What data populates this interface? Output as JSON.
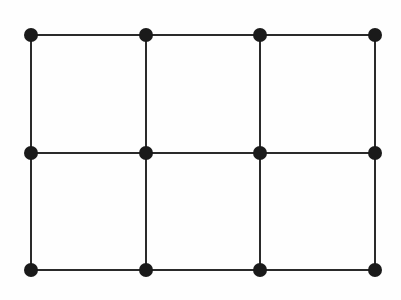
{
  "figure": {
    "type": "grid-graph",
    "rows": 3,
    "cols": 4,
    "column_x": [
      31,
      146,
      260,
      375
    ],
    "row_y": [
      35,
      153,
      270
    ],
    "node_radius": 7,
    "edge_width": 2,
    "node_color": "#1a1a1a",
    "edge_color": "#2a2a2a",
    "background": "#fefefe",
    "nodes": [
      {
        "id": "v-0-0",
        "row": 0,
        "col": 0
      },
      {
        "id": "v-0-1",
        "row": 0,
        "col": 1
      },
      {
        "id": "v-0-2",
        "row": 0,
        "col": 2
      },
      {
        "id": "v-0-3",
        "row": 0,
        "col": 3
      },
      {
        "id": "v-1-0",
        "row": 1,
        "col": 0
      },
      {
        "id": "v-1-1",
        "row": 1,
        "col": 1
      },
      {
        "id": "v-1-2",
        "row": 1,
        "col": 2
      },
      {
        "id": "v-1-3",
        "row": 1,
        "col": 3
      },
      {
        "id": "v-2-0",
        "row": 2,
        "col": 0
      },
      {
        "id": "v-2-1",
        "row": 2,
        "col": 1
      },
      {
        "id": "v-2-2",
        "row": 2,
        "col": 2
      },
      {
        "id": "v-2-3",
        "row": 2,
        "col": 3
      }
    ],
    "edge_count": 17,
    "node_count": 12
  }
}
